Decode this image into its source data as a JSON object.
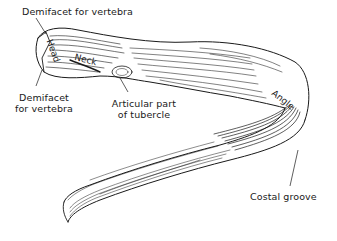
{
  "diagram": {
    "labels": {
      "demifacet_top": "Demifacet for vertebra",
      "demifacet_bottom_line1": "Demifacet",
      "demifacet_bottom_line2": "for vertebra",
      "head": "Head",
      "neck": "Neck",
      "tubercle_line1": "Articular part",
      "tubercle_line2": "of tubercle",
      "angle": "Angle",
      "costal_groove": "Costal groove"
    },
    "colors": {
      "ink": "#1a1a1a",
      "background": "#ffffff"
    }
  }
}
